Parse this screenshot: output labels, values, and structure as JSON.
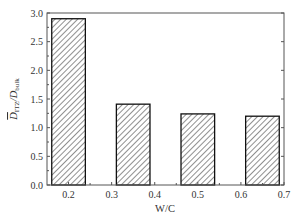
{
  "chart_data": {
    "type": "bar",
    "title": "",
    "xlabel": "W/C",
    "ylabel": "D̄_ITZ / D_bulk",
    "ylabel_parts": {
      "main": "D",
      "main_sub": "ITZ",
      "sep": "/",
      "den": "D",
      "den_sub": "bulk"
    },
    "categories": [
      "0.2",
      "0.35",
      "0.5",
      "0.65"
    ],
    "x": [
      0.2,
      0.35,
      0.5,
      0.65
    ],
    "values": [
      2.9,
      1.41,
      1.24,
      1.2
    ],
    "bar_width": 0.078,
    "xlim": [
      0.15,
      0.7
    ],
    "ylim": [
      0.0,
      3.0
    ],
    "xticks": [
      "0.2",
      "0.3",
      "0.4",
      "0.5",
      "0.6",
      "0.7"
    ],
    "yticks": [
      "0.0",
      "0.5",
      "1.0",
      "1.5",
      "2.0",
      "2.5",
      "3.0"
    ],
    "bar_fill": "hatched",
    "bar_edge_color": "#111111",
    "hatch_color": "#333333",
    "grid": false,
    "legend": null
  }
}
